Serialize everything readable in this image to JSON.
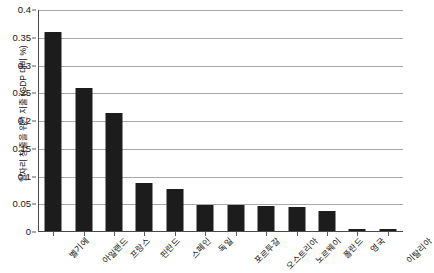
{
  "chart_data": {
    "type": "bar",
    "title": "",
    "subtitle": "",
    "xlabel": "",
    "ylabel": "일자리 창출을 위한 지출 (GDP 대비 %)",
    "ylim": [
      0,
      0.4
    ],
    "ytick_labels": [
      "0.4",
      "0.35",
      "0.3",
      "0.25",
      "0.2",
      "0.15",
      "0.1",
      "0.05",
      "0"
    ],
    "ytick_values": [
      0.4,
      0.35,
      0.3,
      0.25,
      0.2,
      0.15,
      0.1,
      0.05,
      0
    ],
    "grid": true,
    "legend": "none",
    "bar_color": "#1c1c1c",
    "categories": [
      "벨기에",
      "아일랜드",
      "프랑스",
      "핀란드",
      "스페인",
      "독일",
      "포르투갈",
      "오스트리아",
      "노르웨이",
      "폴란드",
      "영국",
      "이탈리아"
    ],
    "values": [
      0.36,
      0.26,
      0.215,
      0.088,
      0.077,
      0.049,
      0.048,
      0.046,
      0.045,
      0.037,
      0.006,
      0.005
    ]
  },
  "axes": {
    "gridline_color": "#a8a8a8",
    "axis_color": "#4a4a4a",
    "tick_color": "#5a5a5a"
  }
}
